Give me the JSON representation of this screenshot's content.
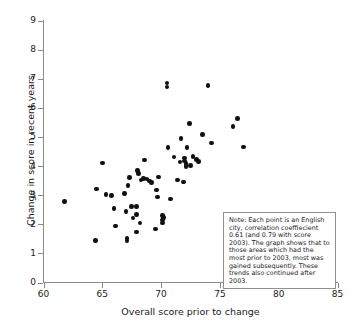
{
  "chart_data": {
    "type": "scatter",
    "title": "",
    "xlabel": "Overall score prior to change",
    "ylabel": "Change in score in recent years",
    "xlim": [
      60,
      85
    ],
    "ylim": [
      0,
      9
    ],
    "xticks": [
      60,
      65,
      70,
      75,
      80,
      85
    ],
    "yticks": [
      0,
      1,
      2,
      3,
      4,
      5,
      6,
      7,
      8,
      9
    ],
    "grid": false,
    "legend": null,
    "marker": "filled-circle",
    "marker_color": "#101010",
    "annotation": "Note: Each point is an English city, correlation coeffiecient 0.61 (and 0.79 with score 2003). The graph shows that to those areas which had the most prior to 2003, most was gained subsequently. These trends also continued after 2003.",
    "correlation_coefficient": 0.61,
    "correlation_coefficient_with_score_2003": 0.79,
    "points": [
      [
        61.8,
        2.79
      ],
      [
        64.4,
        1.45
      ],
      [
        64.5,
        3.21
      ],
      [
        65.0,
        4.11
      ],
      [
        65.3,
        3.02
      ],
      [
        65.8,
        2.99
      ],
      [
        66.0,
        2.55
      ],
      [
        66.1,
        1.94
      ],
      [
        66.9,
        3.05
      ],
      [
        67.0,
        2.43
      ],
      [
        67.1,
        1.42
      ],
      [
        67.1,
        1.52
      ],
      [
        67.2,
        3.33
      ],
      [
        67.3,
        3.6
      ],
      [
        67.5,
        2.62
      ],
      [
        67.6,
        2.21
      ],
      [
        67.9,
        2.61
      ],
      [
        67.9,
        2.33
      ],
      [
        67.9,
        1.74
      ],
      [
        68.0,
        3.85
      ],
      [
        68.1,
        3.75
      ],
      [
        68.2,
        2.05
      ],
      [
        68.3,
        3.52
      ],
      [
        68.5,
        3.58
      ],
      [
        68.6,
        4.21
      ],
      [
        68.8,
        3.55
      ],
      [
        69.0,
        3.48
      ],
      [
        69.2,
        3.44
      ],
      [
        69.5,
        1.84
      ],
      [
        69.6,
        3.18
      ],
      [
        69.7,
        2.94
      ],
      [
        69.8,
        3.63
      ],
      [
        70.1,
        2.31
      ],
      [
        70.1,
        2.15
      ],
      [
        70.1,
        2.05
      ],
      [
        70.2,
        2.24
      ],
      [
        70.5,
        6.85
      ],
      [
        70.5,
        6.72
      ],
      [
        70.6,
        4.63
      ],
      [
        70.8,
        2.87
      ],
      [
        71.1,
        4.31
      ],
      [
        71.4,
        3.52
      ],
      [
        71.6,
        4.14
      ],
      [
        71.7,
        4.95
      ],
      [
        71.9,
        3.45
      ],
      [
        72.0,
        4.27
      ],
      [
        72.0,
        4.18
      ],
      [
        72.1,
        4.08
      ],
      [
        72.1,
        3.98
      ],
      [
        72.2,
        4.63
      ],
      [
        72.4,
        5.46
      ],
      [
        72.5,
        4.02
      ],
      [
        72.7,
        4.32
      ],
      [
        73.0,
        4.22
      ],
      [
        73.2,
        4.15
      ],
      [
        73.5,
        5.08
      ],
      [
        74.0,
        6.76
      ],
      [
        74.3,
        4.79
      ],
      [
        76.1,
        5.36
      ],
      [
        76.5,
        5.64
      ],
      [
        77.0,
        4.66
      ]
    ]
  },
  "note": {
    "text": "Note: Each point is an English city, correlation coeffiecient 0.61 (and 0.79 with score 2003). The graph shows that to those areas which had the most prior to 2003, most was gained subsequently. These trends also continued after 2003."
  }
}
